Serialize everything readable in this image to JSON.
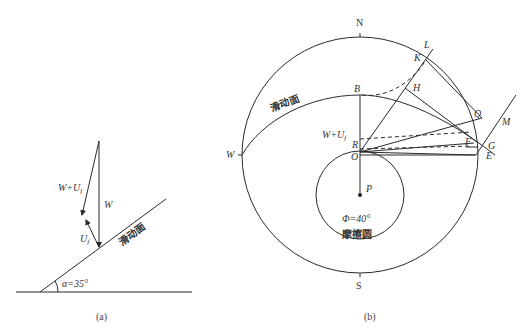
{
  "figure_a": {
    "caption": "(a)",
    "labels": {
      "W": "W",
      "W_plus_Uf": "W+U",
      "Uf": "U",
      "subscript_f": "f",
      "slip_surface": "滑动面",
      "angle": "α=35°"
    },
    "slope_angle_deg": 35
  },
  "figure_b": {
    "caption": "(b)",
    "compass": {
      "north": "N",
      "south": "S",
      "west": "W"
    },
    "slip_surface_label": "滑动面",
    "friction_circle_label": "摩擦圆",
    "friction_angle": "Φ=40°",
    "friction_angle_deg": 40,
    "points": {
      "B": "B",
      "R": "R",
      "O": "O",
      "P": "P",
      "L": "L",
      "K": "K",
      "H": "H",
      "Q": "Q",
      "M": "M",
      "F": "F",
      "G": "G",
      "E": "E"
    },
    "W_plus_Uf": "W+U",
    "subscript_f": "f"
  }
}
